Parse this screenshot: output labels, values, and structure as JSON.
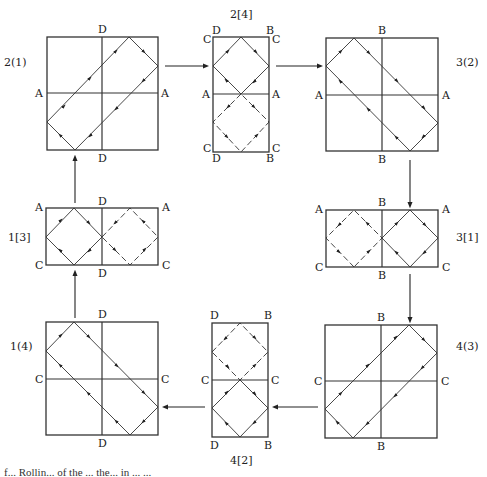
{
  "panels": [
    {
      "id": "2(1)",
      "label": "2(1)",
      "type": "square",
      "edge_labels": {
        "top": "D",
        "bottom": "D",
        "left": "A",
        "right": "A"
      }
    },
    {
      "id": "2[4]",
      "label": "2[4]",
      "type": "tall",
      "corner_labels": {
        "top_left_outer": "D",
        "top_left_side": "C",
        "top_right_outer": "B",
        "top_right_side": "C",
        "bottom_left_outer": "D",
        "bottom_left_side": "C",
        "bottom_right_outer": "B",
        "bottom_right_side": "C"
      },
      "edge_labels": {
        "left": "A",
        "right": "A"
      }
    },
    {
      "id": "3(2)",
      "label": "3(2)",
      "type": "square",
      "edge_labels": {
        "top": "B",
        "bottom": "B",
        "left": "A",
        "right": "A"
      }
    },
    {
      "id": "1[3]",
      "label": "1[3]",
      "type": "wide",
      "corner_labels": {
        "top_left": "A",
        "top_right": "A",
        "bottom_left": "C",
        "bottom_right": "C"
      },
      "edge_labels": {
        "top": "D",
        "bottom": "D"
      }
    },
    {
      "id": "3[1]",
      "label": "3[1]",
      "type": "wide",
      "corner_labels": {
        "top_left": "A",
        "top_right": "A",
        "bottom_left": "C",
        "bottom_right": "C"
      },
      "edge_labels": {
        "top": "B",
        "bottom": "B"
      }
    },
    {
      "id": "1(4)",
      "label": "1(4)",
      "type": "square",
      "edge_labels": {
        "top": "D",
        "bottom": "D",
        "left": "C",
        "right": "C"
      }
    },
    {
      "id": "4[2]",
      "label": "4[2]",
      "type": "tall",
      "corner_labels": {
        "top_left": "D",
        "top_right": "B",
        "bottom_left": "D",
        "bottom_right": "B"
      },
      "edge_labels": {
        "left": "C",
        "right": "C"
      }
    },
    {
      "id": "4(3)",
      "label": "4(3)",
      "type": "square",
      "edge_labels": {
        "top": "B",
        "bottom": "B",
        "left": "C",
        "right": "C"
      }
    }
  ],
  "flow": [
    "2(1)",
    "2[4]",
    "3(2)",
    "3[1]",
    "4(3)",
    "4[2]",
    "1(4)",
    "1[3]",
    "2(1)"
  ],
  "caption": "f...   Rollin... of the ... the... in ... ..."
}
